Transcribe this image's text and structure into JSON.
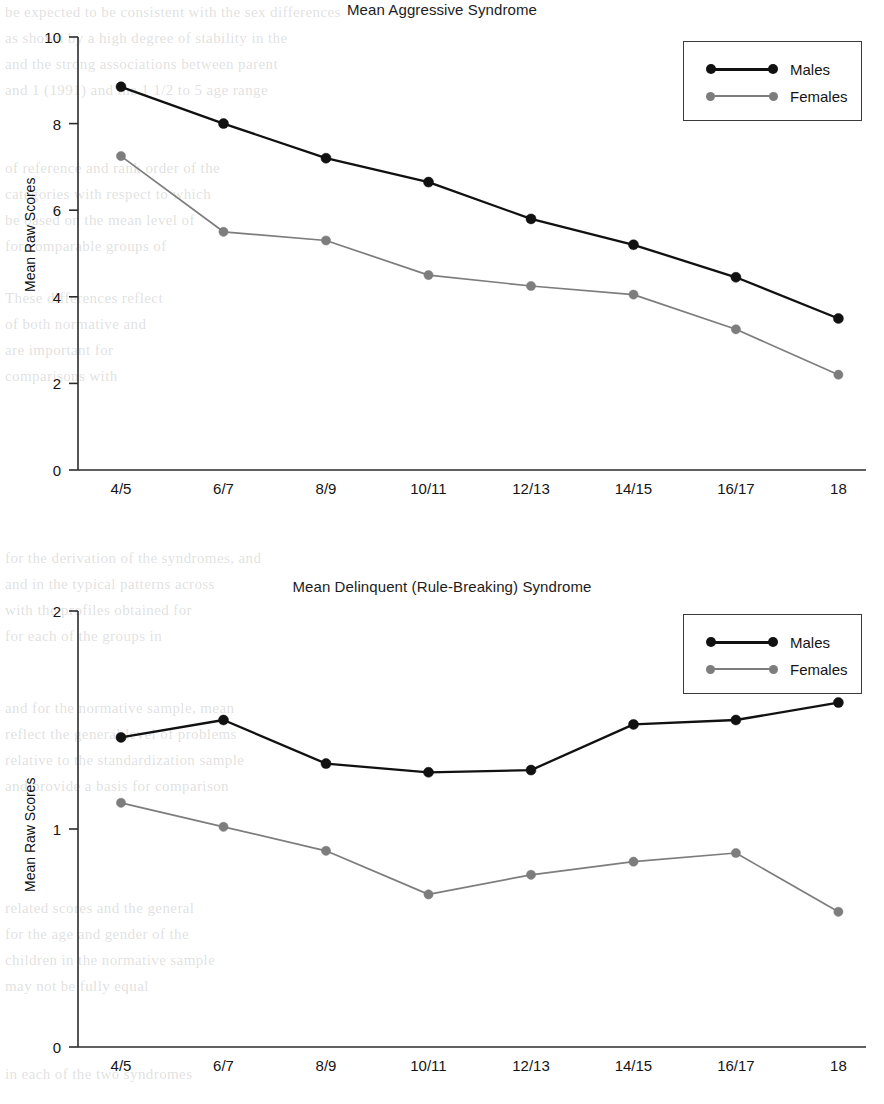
{
  "page": {
    "background": "#ffffff",
    "width": 884,
    "height": 1104
  },
  "colors": {
    "males": "#111111",
    "females": "#7d7d7d",
    "axis": "#2b2b2b",
    "text": "#141414",
    "legend_border": "#3a3a3a"
  },
  "figures": [
    {
      "id": "aggressive",
      "title": "Mean Aggressive Syndrome",
      "ylabel": "Mean Raw Scores",
      "legend": {
        "males": "Males",
        "females": "Females"
      }
    },
    {
      "id": "delinquent",
      "title": "Mean Delinquent (Rule-Breaking) Syndrome",
      "ylabel": "Mean Raw Scores",
      "legend": {
        "males": "Males",
        "females": "Females"
      }
    }
  ],
  "chart_data": [
    {
      "type": "line",
      "title": "Mean Aggressive Syndrome",
      "xlabel": "",
      "ylabel": "Mean Raw Scores",
      "categories": [
        "4/5",
        "6/7",
        "8/9",
        "10/11",
        "12/13",
        "14/15",
        "16/17",
        "18"
      ],
      "ylim": [
        0,
        10
      ],
      "yticks": [
        0,
        2,
        4,
        6,
        8,
        10
      ],
      "grid": false,
      "legend_position": "top-right",
      "series": [
        {
          "name": "Males",
          "color": "#111111",
          "values": [
            8.85,
            8.0,
            7.2,
            6.65,
            5.8,
            5.2,
            4.45,
            3.5
          ]
        },
        {
          "name": "Females",
          "color": "#7d7d7d",
          "values": [
            7.25,
            5.5,
            5.3,
            4.5,
            4.25,
            4.05,
            3.25,
            2.2
          ]
        }
      ]
    },
    {
      "type": "line",
      "title": "Mean Delinquent (Rule-Breaking) Syndrome",
      "xlabel": "",
      "ylabel": "Mean Raw Scores",
      "categories": [
        "4/5",
        "6/7",
        "8/9",
        "10/11",
        "12/13",
        "14/15",
        "16/17",
        "18"
      ],
      "ylim": [
        0,
        2
      ],
      "yticks": [
        0,
        1,
        2
      ],
      "grid": false,
      "legend_position": "top-right",
      "series": [
        {
          "name": "Males",
          "color": "#111111",
          "values": [
            1.42,
            1.5,
            1.3,
            1.26,
            1.27,
            1.48,
            1.5,
            1.58
          ]
        },
        {
          "name": "Females",
          "color": "#7d7d7d",
          "values": [
            1.12,
            1.01,
            0.9,
            0.7,
            0.79,
            0.85,
            0.89,
            0.62
          ]
        }
      ]
    }
  ],
  "geometry": [
    {
      "x0": 78,
      "x1": 862,
      "y_top": 37,
      "y_bottom": 470,
      "legend": {
        "left": 683,
        "top": 41,
        "width": 179,
        "height": 80
      }
    },
    {
      "x0": 78,
      "x1": 862,
      "y_top": 59,
      "y_bottom": 495,
      "legend": {
        "left": 683,
        "top": 62,
        "width": 179,
        "height": 80
      }
    }
  ]
}
